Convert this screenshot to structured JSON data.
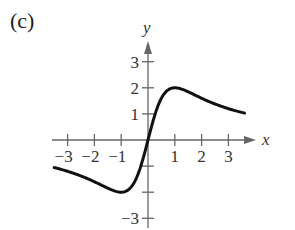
{
  "figure": {
    "panel_label": "(c)"
  },
  "chart_data": {
    "type": "line",
    "title": "",
    "panel_label": "(c)",
    "xlabel": "x",
    "ylabel": "y",
    "xlim": [
      -3.5,
      3.6
    ],
    "ylim": [
      -3.3,
      3.6
    ],
    "x_ticks": [
      -3,
      -2,
      -1,
      1,
      2,
      3
    ],
    "x_tick_labels": [
      "−3",
      "−2",
      "−1",
      "1",
      "2",
      "3"
    ],
    "y_ticks": [
      3,
      2,
      1,
      -1,
      -2,
      -3
    ],
    "y_tick_labels": [
      "3",
      "2",
      "1",
      "",
      "",
      "−3"
    ],
    "grid": false,
    "legend": null,
    "function": "y = 4x / (x^2 + 1)",
    "series": [
      {
        "name": "curve",
        "color": "#111111",
        "x": [
          -3.5,
          -3,
          -2.5,
          -2,
          -1.5,
          -1,
          -0.75,
          -0.5,
          -0.25,
          0,
          0.25,
          0.5,
          0.75,
          1,
          1.5,
          2,
          2.5,
          3,
          3.6
        ],
        "y": [
          -1.06,
          -1.2,
          -1.38,
          -1.6,
          -1.85,
          -2.0,
          -1.92,
          -1.6,
          -0.94,
          0,
          0.94,
          1.6,
          1.92,
          2.0,
          1.85,
          1.6,
          1.38,
          1.2,
          1.03
        ]
      }
    ],
    "extrema": [
      {
        "type": "max",
        "x": 1,
        "y": 2
      },
      {
        "type": "min",
        "x": -1,
        "y": -2
      }
    ]
  }
}
